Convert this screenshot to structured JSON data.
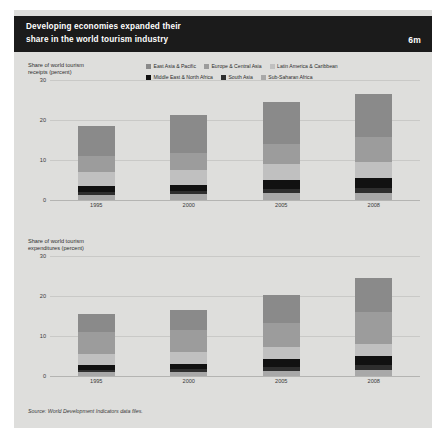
{
  "header": {
    "title_line1": "Developing economies expanded their",
    "title_line2": "share in the world tourism industry",
    "badge": "6m"
  },
  "legend": {
    "rows": [
      [
        {
          "label": "East Asia & Pacific",
          "color": "#8a8a8a"
        },
        {
          "label": "Europe & Central Asia",
          "color": "#9c9c9c"
        },
        {
          "label": "Latin America & Caribbean",
          "color": "#c0c0c0"
        }
      ],
      [
        {
          "label": "Middle East & North Africa",
          "color": "#111111"
        },
        {
          "label": "South Asia",
          "color": "#2e2e2e"
        },
        {
          "label": "Sub-Saharan Africa",
          "color": "#a8a8a8"
        }
      ]
    ]
  },
  "source": "Source: World Development Indicators data files.",
  "chart_data": [
    {
      "id": "receipts",
      "type": "bar",
      "stacked": true,
      "title_line1": "Share of world tourism",
      "title_line2": "receipts (percent)",
      "xlabel": "",
      "ylabel": "",
      "ylim": [
        0,
        30
      ],
      "yticks": [
        0,
        10,
        20,
        30
      ],
      "ytick_labels": [
        "0",
        "10",
        "20",
        "30"
      ],
      "grid": true,
      "legend_position": "top-right",
      "categories": [
        "1995",
        "2000",
        "2005",
        "2008"
      ],
      "series": [
        {
          "name": "Sub-Saharan Africa",
          "color": "#a8a8a8",
          "values": [
            1.3,
            1.4,
            1.7,
            1.8
          ]
        },
        {
          "name": "South Asia",
          "color": "#2e2e2e",
          "values": [
            0.7,
            0.8,
            1.0,
            1.1
          ]
        },
        {
          "name": "Middle East & North Africa",
          "color": "#111111",
          "values": [
            1.4,
            1.6,
            2.3,
            2.5
          ]
        },
        {
          "name": "Latin America & Caribbean",
          "color": "#c0c0c0",
          "values": [
            3.6,
            3.8,
            3.9,
            4.0
          ]
        },
        {
          "name": "Europe & Central Asia",
          "color": "#9c9c9c",
          "values": [
            4.0,
            4.2,
            5.0,
            6.4
          ]
        },
        {
          "name": "East Asia & Pacific",
          "color": "#8a8a8a",
          "values": [
            7.6,
            9.4,
            10.6,
            10.8
          ]
        }
      ],
      "totals": [
        18.6,
        21.2,
        24.5,
        26.6
      ]
    },
    {
      "id": "expenditures",
      "type": "bar",
      "stacked": true,
      "title_line1": "Share of world tourism",
      "title_line2": "expenditures (percent)",
      "xlabel": "",
      "ylabel": "",
      "ylim": [
        0,
        30
      ],
      "yticks": [
        0,
        10,
        20,
        30
      ],
      "ytick_labels": [
        "0",
        "10",
        "20",
        "30"
      ],
      "grid": true,
      "legend_position": "top-right",
      "categories": [
        "1995",
        "2000",
        "2005",
        "2008"
      ],
      "series": [
        {
          "name": "Sub-Saharan Africa",
          "color": "#a8a8a8",
          "values": [
            1.0,
            1.1,
            1.3,
            1.6
          ]
        },
        {
          "name": "South Asia",
          "color": "#2e2e2e",
          "values": [
            0.6,
            0.7,
            1.0,
            1.2
          ]
        },
        {
          "name": "Middle East & North Africa",
          "color": "#111111",
          "values": [
            1.1,
            1.2,
            1.9,
            2.2
          ]
        },
        {
          "name": "Latin America & Caribbean",
          "color": "#c0c0c0",
          "values": [
            2.8,
            2.9,
            3.0,
            3.1
          ]
        },
        {
          "name": "Europe & Central Asia",
          "color": "#9c9c9c",
          "values": [
            5.4,
            5.6,
            6.1,
            8.0
          ]
        },
        {
          "name": "East Asia & Pacific",
          "color": "#8a8a8a",
          "values": [
            4.6,
            5.0,
            7.0,
            8.4
          ]
        }
      ],
      "totals": [
        15.5,
        16.5,
        20.3,
        24.5
      ]
    }
  ]
}
